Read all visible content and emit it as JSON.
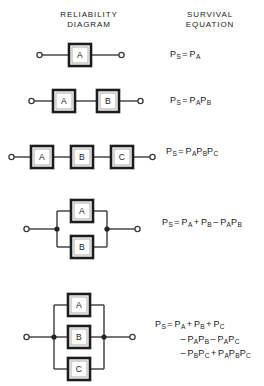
{
  "headers": {
    "diagram": "RELIABILITY\nDIAGRAM",
    "equation": "SURVIVAL\nEQUATION"
  },
  "labels": {
    "A": "A",
    "B": "B",
    "C": "C"
  },
  "rows": [
    {
      "id": "single",
      "topology": "series",
      "blocks": [
        "A"
      ],
      "equation_text": "PS = PA"
    },
    {
      "id": "series-two",
      "topology": "series",
      "blocks": [
        "A",
        "B"
      ],
      "equation_text": "PS = PA PB"
    },
    {
      "id": "series-three",
      "topology": "series",
      "blocks": [
        "A",
        "B",
        "C"
      ],
      "equation_text": "PS = PA PB PC"
    },
    {
      "id": "parallel-two",
      "topology": "parallel",
      "blocks": [
        "A",
        "B"
      ],
      "equation_text": "PS = PA + PB - PA PB"
    },
    {
      "id": "parallel-three",
      "topology": "parallel",
      "blocks": [
        "A",
        "B",
        "C"
      ],
      "equation_text": "PS = PA + PB + PC - PA PB - PA PC - PB PC + PA PB PC"
    }
  ],
  "equations": {
    "eq1": {
      "lhs": "P",
      "lhs_sub": "S",
      "eq": "=",
      "terms": [
        {
          "sym": "P",
          "sub": "A"
        }
      ]
    },
    "eq2": {
      "lhs": "P",
      "lhs_sub": "S",
      "eq": "=",
      "terms": [
        {
          "sym": "P",
          "sub": "A"
        },
        {
          "sym": "P",
          "sub": "B"
        }
      ]
    },
    "eq3": {
      "lhs": "P",
      "lhs_sub": "S",
      "eq": "=",
      "terms": [
        {
          "sym": "P",
          "sub": "A"
        },
        {
          "sym": "P",
          "sub": "B"
        },
        {
          "sym": "P",
          "sub": "C"
        }
      ]
    },
    "eq4": {
      "lhs": "P",
      "lhs_sub": "S",
      "eq": "=",
      "t1": "P",
      "t1s": "A",
      "op1": "+",
      "t2": "P",
      "t2s": "B",
      "op2": "–",
      "t3": "P",
      "t3s": "A",
      "t4": "P",
      "t4s": "B"
    },
    "eq5": {
      "lhs": "P",
      "lhs_sub": "S",
      "eq": "=",
      "line1": {
        "t1": "P",
        "t1s": "A",
        "op1": "+",
        "t2": "P",
        "t2s": "B",
        "op2": "+",
        "t3": "P",
        "t3s": "C"
      },
      "line2": {
        "op0": "–",
        "t1": "P",
        "t1s": "A",
        "t2": "P",
        "t2s": "B",
        "op1": "–",
        "t3": "P",
        "t3s": "A",
        "t4": "P",
        "t4s": "C"
      },
      "line3": {
        "op0": "–",
        "t1": "P",
        "t1s": "B",
        "t2": "P",
        "t2s": "C",
        "op1": "+",
        "t3": "P",
        "t3s": "A",
        "t4": "P",
        "t4s": "B",
        "t5": "P",
        "t5s": "C"
      }
    }
  },
  "colors": {
    "ink": "#1a1a1a",
    "wire": "#3a3a3a",
    "box_border": "#1c1c1c",
    "box_inner": "#9a9a9a",
    "background": "#ffffff"
  }
}
